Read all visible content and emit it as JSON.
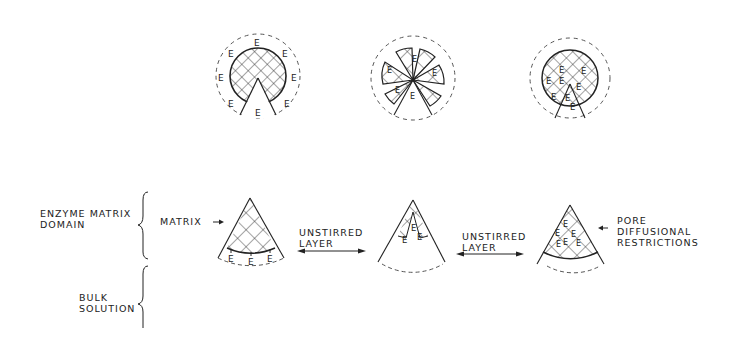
{
  "diagram": {
    "top_row": {
      "circles": [
        {
          "id": "surface-bound",
          "enzyme_label": "E",
          "enzyme_count": 8
        },
        {
          "id": "segmented-matrix",
          "enzyme_label": "E",
          "enzyme_count": 6
        },
        {
          "id": "entrapped",
          "enzyme_label": "E",
          "enzyme_count": 8
        }
      ]
    },
    "left_labels": {
      "enzyme_matrix_domain_line1": "ENZYME MATRIX",
      "enzyme_matrix_domain_line2": "DOMAIN",
      "bulk_solution_line1": "BULK",
      "bulk_solution_line2": "SOLUTION"
    },
    "annotations": {
      "matrix": "MATRIX",
      "unstirred_layer_1_line1": "UNSTIRRED",
      "unstirred_layer_1_line2": "LAYER",
      "unstirred_layer_2_line1": "UNSTIRRED",
      "unstirred_layer_2_line2": "LAYER",
      "pore_line1": "PORE",
      "pore_line2": "DIFFUSIONAL",
      "pore_line3": "RESTRICTIONS"
    },
    "enzyme_symbol": "E",
    "colors": {
      "ink": "#222222",
      "background": "#ffffff"
    }
  }
}
